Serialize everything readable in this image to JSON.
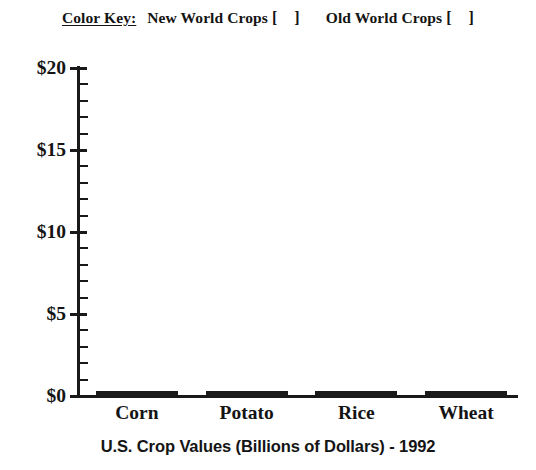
{
  "color_key": {
    "label": "Color Key:",
    "entries": [
      {
        "name": "New World Crops",
        "open": "[",
        "close": "]",
        "swatch_color": "#ffffff"
      },
      {
        "name": "Old World Crops",
        "open": "[",
        "close": "]",
        "swatch_color": "#ffffff"
      }
    ]
  },
  "chart_data": {
    "type": "bar",
    "title": "U.S. Crop Values (Billions of Dollars) - 1992",
    "xlabel": "",
    "ylabel": "",
    "categories": [
      "Corn",
      "Potato",
      "Rice",
      "Wheat"
    ],
    "values": [
      0,
      0,
      0,
      0
    ],
    "ylim": [
      0,
      20
    ],
    "ytick_labels": [
      "$0",
      "$5",
      "$10",
      "$15",
      "$20"
    ],
    "ytick_values": [
      0,
      5,
      10,
      15,
      20
    ],
    "minor_tick_step": 1,
    "grid": false,
    "legend_position": "top-center",
    "legend_entries": [
      "New World Crops",
      "Old World Crops"
    ],
    "bar_color": "#1a1a1a",
    "axis_color": "#191919",
    "note": "Blank worksheet template - bars drawn at zero height"
  }
}
